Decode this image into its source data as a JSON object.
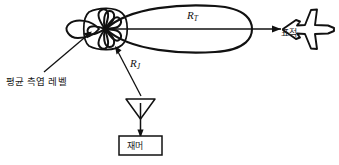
{
  "diagram": {
    "labels": {
      "sidelobe_level": "평균 측엽 레벨",
      "target": "표적",
      "jammer": "재머",
      "range_target": "R",
      "range_target_sub": "T",
      "range_jammer": "R",
      "range_jammer_sub": "J"
    },
    "elements": {
      "main_lobe": "main-lobe",
      "sidelobe_rosette": "sidelobe-rosette",
      "back_lobe": "back-lobe",
      "aircraft": "target-aircraft",
      "jammer_antenna": "jammer-antenna",
      "jammer_box": "jammer-box",
      "boresight_arrow": "boresight-arrow",
      "sidelobe_leader": "sidelobe-leader-arrow",
      "jammer_path": "jammer-path-arrow"
    },
    "colors": {
      "stroke": "#111111",
      "background": "#ffffff",
      "text": "#1a1a1a"
    }
  }
}
